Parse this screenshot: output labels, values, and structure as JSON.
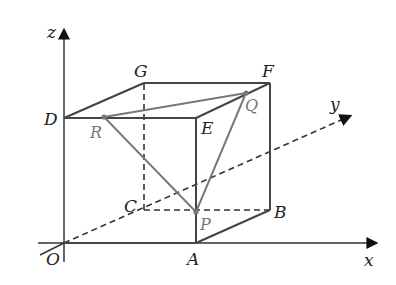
{
  "figure": {
    "type": "3D cube with coordinate axes and inscribed triangle PQR",
    "axes": {
      "x": {
        "label": "x"
      },
      "y": {
        "label": "y"
      },
      "z": {
        "label": "z"
      },
      "origin": {
        "label": "O"
      }
    },
    "vertices": {
      "O": {
        "label": "O"
      },
      "A": {
        "label": "A"
      },
      "B": {
        "label": "B"
      },
      "C": {
        "label": "C"
      },
      "D": {
        "label": "D"
      },
      "E": {
        "label": "E"
      },
      "F": {
        "label": "F"
      },
      "G": {
        "label": "G"
      }
    },
    "points": {
      "P": {
        "label": "P",
        "on_edge": "AE"
      },
      "Q": {
        "label": "Q",
        "on_edge": "EF"
      },
      "R": {
        "label": "R",
        "on_edge": "DE"
      }
    },
    "colors": {
      "edges": "#444444",
      "triangle": "#777777",
      "labels": "#222222",
      "point_labels": "#777777"
    }
  }
}
